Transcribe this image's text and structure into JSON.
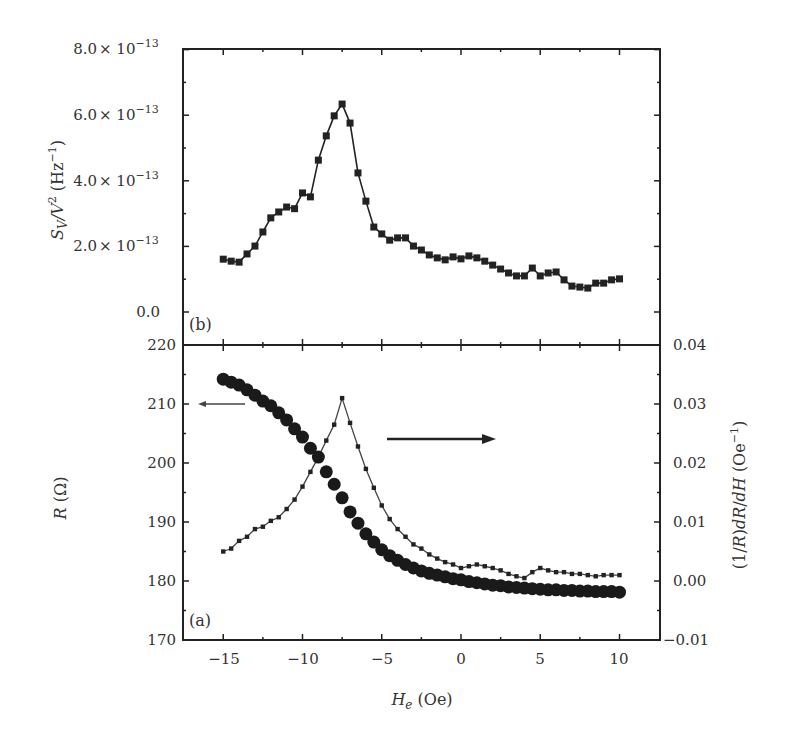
{
  "chart_data": [
    {
      "panel": "b",
      "type": "line",
      "panel_label": "(b)",
      "xlabel": "H_e (Oe)",
      "ylabel": "S_V/V^2 (Hz^-1)",
      "xlim": [
        -17.5,
        12.5
      ],
      "ylim": [
        0,
        8e-13
      ],
      "x_ticks": [
        -15,
        -10,
        -5,
        0,
        5,
        10
      ],
      "y_ticks": [
        "0.0",
        "2.0 × 10^-13",
        "4.0 × 10^-13",
        "6.0 × 10^-13",
        "8.0 × 10^-13"
      ],
      "grid": false,
      "series": [
        {
          "name": "S_V/V^2",
          "marker": "square",
          "unit_scale": "1e-13",
          "x": [
            -15.0,
            -14.5,
            -14.0,
            -13.5,
            -13.0,
            -12.5,
            -12.0,
            -11.5,
            -11.0,
            -10.5,
            -10.0,
            -9.5,
            -9.0,
            -8.5,
            -8.0,
            -7.5,
            -7.0,
            -6.5,
            -6.0,
            -5.5,
            -5.0,
            -4.5,
            -4.0,
            -3.5,
            -3.0,
            -2.5,
            -2.0,
            -1.5,
            -1.0,
            -0.5,
            0.0,
            0.5,
            1.0,
            1.5,
            2.0,
            2.5,
            3.0,
            3.5,
            4.0,
            4.5,
            5.0,
            5.5,
            6.0,
            6.5,
            7.0,
            7.5,
            8.0,
            8.5,
            9.0,
            9.5,
            10.0
          ],
          "values": [
            1.61,
            1.55,
            1.52,
            1.77,
            2.01,
            2.44,
            2.87,
            3.05,
            3.2,
            3.15,
            3.63,
            3.51,
            4.63,
            5.37,
            5.98,
            6.34,
            5.76,
            4.24,
            3.38,
            2.59,
            2.38,
            2.19,
            2.26,
            2.26,
            2.01,
            1.89,
            1.74,
            1.65,
            1.59,
            1.68,
            1.62,
            1.71,
            1.65,
            1.55,
            1.43,
            1.31,
            1.19,
            1.1,
            1.1,
            1.34,
            1.1,
            1.19,
            1.22,
            0.98,
            0.79,
            0.76,
            0.73,
            0.88,
            0.88,
            0.98,
            1.01
          ]
        }
      ]
    },
    {
      "panel": "a",
      "type": "line",
      "panel_label": "(a)",
      "xlabel": "H_e (Oe)",
      "ylabel_left": "R (Ω)",
      "ylabel_right": "(1/R)dR/dH (Oe^-1)",
      "xlim": [
        -17.5,
        12.5
      ],
      "ylim_left": [
        170,
        220
      ],
      "ylim_right": [
        -0.01,
        0.04
      ],
      "x_ticks": [
        -15,
        -10,
        -5,
        0,
        5,
        10
      ],
      "y_ticks_left": [
        170,
        180,
        190,
        200,
        210,
        220
      ],
      "y_ticks_right": [
        "-0.01",
        "0.00",
        "0.01",
        "0.02",
        "0.03",
        "0.04"
      ],
      "grid": false,
      "annotations": [
        {
          "type": "arrow",
          "direction": "left",
          "meaning": "R curve uses left axis"
        },
        {
          "type": "arrow",
          "direction": "right",
          "meaning": "derivative curve uses right axis"
        }
      ],
      "series": [
        {
          "name": "R",
          "axis": "left",
          "marker": "circle",
          "x": [
            -15.0,
            -14.5,
            -14.0,
            -13.5,
            -13.0,
            -12.5,
            -12.0,
            -11.5,
            -11.0,
            -10.5,
            -10.0,
            -9.5,
            -9.0,
            -8.5,
            -8.0,
            -7.5,
            -7.0,
            -6.5,
            -6.0,
            -5.5,
            -5.0,
            -4.5,
            -4.0,
            -3.5,
            -3.0,
            -2.5,
            -2.0,
            -1.5,
            -1.0,
            -0.5,
            0.0,
            0.5,
            1.0,
            1.5,
            2.0,
            2.5,
            3.0,
            3.5,
            4.0,
            4.5,
            5.0,
            5.5,
            6.0,
            6.5,
            7.0,
            7.5,
            8.0,
            8.5,
            9.0,
            9.5,
            10.0
          ],
          "values": [
            214.2,
            213.7,
            213.2,
            212.4,
            211.5,
            210.5,
            209.7,
            208.5,
            207.3,
            205.8,
            204.4,
            202.5,
            201.0,
            198.5,
            196.4,
            194.1,
            191.7,
            189.8,
            188.0,
            186.6,
            185.3,
            184.3,
            183.5,
            182.8,
            182.2,
            181.7,
            181.3,
            181.0,
            180.7,
            180.4,
            180.2,
            179.9,
            179.7,
            179.5,
            179.3,
            179.2,
            179.0,
            178.9,
            178.8,
            178.7,
            178.6,
            178.5,
            178.5,
            178.4,
            178.4,
            178.3,
            178.3,
            178.2,
            178.2,
            178.2,
            178.1
          ]
        },
        {
          "name": "(1/R)dR/dH",
          "axis": "right",
          "marker": "small-square",
          "x": [
            -15.0,
            -14.5,
            -14.0,
            -13.5,
            -13.0,
            -12.5,
            -12.0,
            -11.5,
            -11.0,
            -10.5,
            -10.0,
            -9.5,
            -9.0,
            -8.5,
            -8.0,
            -7.5,
            -7.0,
            -6.5,
            -6.0,
            -5.5,
            -5.0,
            -4.5,
            -4.0,
            -3.5,
            -3.0,
            -2.5,
            -2.0,
            -1.5,
            -1.0,
            -0.5,
            0.0,
            0.5,
            1.0,
            1.5,
            2.0,
            2.5,
            3.0,
            3.5,
            4.0,
            4.5,
            5.0,
            5.5,
            6.0,
            6.5,
            7.0,
            7.5,
            8.0,
            8.5,
            9.0,
            9.5,
            10.0
          ],
          "values": [
            0.005,
            0.0055,
            0.0068,
            0.0075,
            0.0088,
            0.0092,
            0.0102,
            0.0108,
            0.0122,
            0.0138,
            0.016,
            0.0185,
            0.021,
            0.0238,
            0.0265,
            0.031,
            0.0268,
            0.0228,
            0.019,
            0.0158,
            0.0128,
            0.0105,
            0.0088,
            0.0075,
            0.0062,
            0.0055,
            0.0045,
            0.0038,
            0.0032,
            0.0028,
            0.0022,
            0.0025,
            0.0028,
            0.0025,
            0.0022,
            0.0018,
            0.0012,
            0.0008,
            0.0005,
            0.0015,
            0.0022,
            0.0018,
            0.0015,
            0.0015,
            0.0012,
            0.0012,
            0.001,
            0.0008,
            0.001,
            0.001,
            0.001
          ]
        }
      ]
    }
  ],
  "labels": {
    "top_ticks": [
      "0.0",
      "2.0",
      "4.0",
      "6.0",
      "8.0"
    ],
    "exp_times": "× 10",
    "exp": "−13",
    "panel_b": "(b)",
    "panel_a": "(a)",
    "left_ticks_a": [
      "170",
      "180",
      "190",
      "200",
      "210",
      "220"
    ],
    "right_ticks_a": [
      "−0.01",
      "0.00",
      "0.01",
      "0.02",
      "0.03",
      "0.04"
    ],
    "x_ticks": [
      "−15",
      "−10",
      "−5",
      "0",
      "5",
      "10"
    ],
    "xlabel_main": "H",
    "xlabel_sub": "e",
    "xlabel_unit": " (Oe)",
    "ylabel_top": "S",
    "ylabel_top_sub": "V",
    "ylabel_top_rest": "/V",
    "ylabel_top_sup": "2",
    "ylabel_top_unit": " (Hz",
    "ylabel_top_unit_sup": "−1",
    "ylabel_top_close": ")",
    "ylabel_left_a": "R",
    "ylabel_left_a_unit": " (Ω)",
    "ylabel_right_a_1": "(1/",
    "ylabel_right_a_R": "R",
    "ylabel_right_a_2": ")",
    "ylabel_right_a_d1": "dR",
    "ylabel_right_a_slash": "/",
    "ylabel_right_a_d2": "dH",
    "ylabel_right_a_unit": " (Oe",
    "ylabel_right_a_sup": "−1",
    "ylabel_right_a_close": ")"
  },
  "colors": {
    "ink": "#222222",
    "background": "#ffffff"
  }
}
